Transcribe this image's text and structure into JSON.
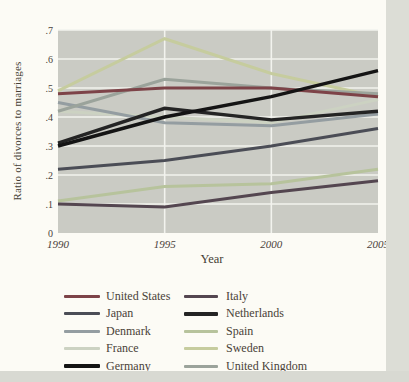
{
  "chart_data": {
    "type": "line",
    "title": "",
    "xlabel": "Year",
    "ylabel": "Ratio of divorces to marriages",
    "x": [
      1990,
      1995,
      2000,
      2005
    ],
    "x_tick_labels": [
      "1990",
      "1995",
      "2000",
      "2005"
    ],
    "y_tick_values": [
      0,
      0.1,
      0.2,
      0.3,
      0.4,
      0.5,
      0.6,
      0.7
    ],
    "y_tick_labels": [
      "0",
      ".1",
      ".2",
      ".3",
      ".4",
      ".5",
      ".6",
      ".7"
    ],
    "ylim": [
      0,
      0.7
    ],
    "grid": true,
    "legend_position": "bottom-two-columns",
    "plot_background": "#cacbc4",
    "grid_color": "#f2f3ee",
    "series": [
      {
        "name": "United States",
        "color": "#7d4348",
        "stroke_width": 3,
        "values": [
          0.48,
          0.5,
          0.5,
          0.47
        ]
      },
      {
        "name": "Japan",
        "color": "#4b4d56",
        "stroke_width": 3,
        "values": [
          0.22,
          0.25,
          0.3,
          0.36
        ]
      },
      {
        "name": "Denmark",
        "color": "#949da1",
        "stroke_width": 3,
        "values": [
          0.45,
          0.38,
          0.37,
          0.41
        ]
      },
      {
        "name": "France",
        "color": "#ccd2c2",
        "stroke_width": 3,
        "values": [
          0.42,
          0.4,
          0.38,
          0.46
        ]
      },
      {
        "name": "Germany",
        "color": "#141414",
        "stroke_width": 3.4,
        "values": [
          0.3,
          0.4,
          0.47,
          0.56
        ]
      },
      {
        "name": "Italy",
        "color": "#544650",
        "stroke_width": 3,
        "values": [
          0.1,
          0.09,
          0.14,
          0.18
        ]
      },
      {
        "name": "Netherlands",
        "color": "#242424",
        "stroke_width": 3.4,
        "values": [
          0.31,
          0.43,
          0.39,
          0.42
        ]
      },
      {
        "name": "Spain",
        "color": "#b7c39c",
        "stroke_width": 3,
        "values": [
          0.11,
          0.16,
          0.17,
          0.22
        ]
      },
      {
        "name": "Sweden",
        "color": "#c6cc9e",
        "stroke_width": 3,
        "values": [
          0.49,
          0.67,
          0.55,
          0.47
        ]
      },
      {
        "name": "United Kingdom",
        "color": "#9ba39b",
        "stroke_width": 3,
        "values": [
          0.42,
          0.53,
          0.5,
          0.48
        ]
      }
    ],
    "draw_order": [
      3,
      8,
      7,
      2,
      9,
      0,
      1,
      5,
      6,
      4
    ]
  },
  "legend": {
    "left_column_series": [
      0,
      1,
      2,
      3,
      4
    ],
    "right_column_series": [
      5,
      6,
      7,
      8,
      9
    ]
  }
}
